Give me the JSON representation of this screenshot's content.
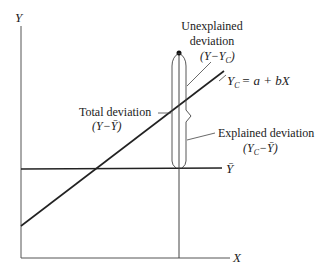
{
  "diagram": {
    "type": "regression-deviation-diagram",
    "axes": {
      "y_label": "Y",
      "x_label": "X"
    },
    "mean_line_label": "Ȳ",
    "regression_line": {
      "label_lhs": "Y",
      "label_lhs_sub": "C",
      "label_rhs": "= a + bX"
    },
    "annotations": {
      "unexplained": {
        "line1": "Unexplained",
        "line2": "deviation",
        "formula": "(Y−Y",
        "formula_sub": "C",
        "formula_end": ")"
      },
      "total": {
        "line1": "Total deviation",
        "formula": "(Y−Ȳ)"
      },
      "explained": {
        "line1": "Explained deviation",
        "formula": "(Y",
        "formula_sub": "C",
        "formula_end": "−Ȳ)"
      }
    },
    "colors": {
      "line": "#222222",
      "thin": "#444444",
      "background": "#ffffff"
    }
  }
}
